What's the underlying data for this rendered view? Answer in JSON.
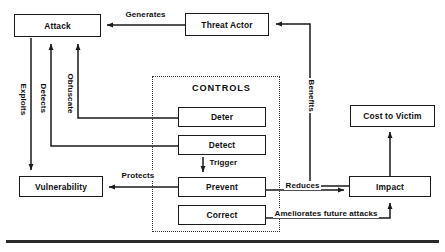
{
  "diagram": {
    "colors": {
      "stroke": "#1a1a1a",
      "text": "#101010",
      "dotted": "#333333",
      "background": "#ffffff"
    },
    "nodes": [
      {
        "id": "attack",
        "label": "Attack",
        "x": 14,
        "y": 14,
        "w": 87,
        "h": 23
      },
      {
        "id": "threat-actor",
        "label": "Threat Actor",
        "x": 185,
        "y": 13,
        "w": 84,
        "h": 23
      },
      {
        "id": "cost-to-victim",
        "label": "Cost to Victim",
        "x": 350,
        "y": 105,
        "w": 85,
        "h": 22
      },
      {
        "id": "deter",
        "label": "Deter",
        "x": 178,
        "y": 107,
        "w": 88,
        "h": 20
      },
      {
        "id": "detect",
        "label": "Detect",
        "x": 178,
        "y": 135,
        "w": 88,
        "h": 20
      },
      {
        "id": "prevent",
        "label": "Prevent",
        "x": 178,
        "y": 177,
        "w": 88,
        "h": 20
      },
      {
        "id": "correct",
        "label": "Correct",
        "x": 178,
        "y": 205,
        "w": 88,
        "h": 20
      },
      {
        "id": "vulnerability",
        "label": "Vulnerability",
        "x": 19,
        "y": 176,
        "w": 84,
        "h": 21
      },
      {
        "id": "impact",
        "label": "Impact",
        "x": 349,
        "y": 176,
        "w": 82,
        "h": 21
      }
    ],
    "group": {
      "id": "controls",
      "label": "CONTROLS",
      "x": 152,
      "y": 76,
      "w": 128,
      "h": 156,
      "label_x": 190,
      "label_y": 84
    },
    "edges": [
      {
        "id": "generates",
        "label": "Generates",
        "from": "threat-actor",
        "to": "attack"
      },
      {
        "id": "benefits",
        "label": "Benefits",
        "from": "impact",
        "to": "threat-actor"
      },
      {
        "id": "exploits",
        "label": "Exploits",
        "from": "attack",
        "to": "vulnerability"
      },
      {
        "id": "detects",
        "label": "Detects",
        "from": "detect",
        "to": "attack"
      },
      {
        "id": "obfuscate",
        "label": "Obfuscate",
        "from": "deter",
        "to": "attack"
      },
      {
        "id": "protects",
        "label": "Protects",
        "from": "prevent",
        "to": "vulnerability"
      },
      {
        "id": "trigger",
        "label": "Trigger",
        "from": "detect",
        "to": "prevent"
      },
      {
        "id": "reduces",
        "label": "Reduces",
        "from": "prevent",
        "to": "impact"
      },
      {
        "id": "ameliorates",
        "label": "Ameliorates future attacks",
        "from": "correct",
        "to": "impact"
      },
      {
        "id": "cost",
        "label": "",
        "from": "impact",
        "to": "cost-to-victim"
      }
    ],
    "edge_labels": {
      "generates": "Generates",
      "benefits": "Benefits",
      "exploits": "Exploits",
      "detects": "Detects",
      "obfuscate": "Obfuscate",
      "protects": "Protects",
      "trigger": "Trigger",
      "reduces": "Reduces",
      "ameliorates": "Ameliorates future attacks"
    }
  }
}
